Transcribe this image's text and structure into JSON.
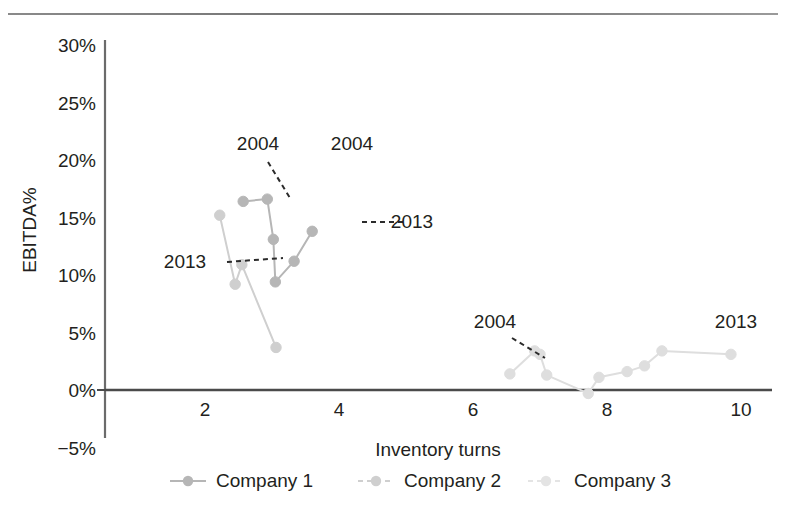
{
  "chart_data": {
    "type": "scatter",
    "title": "",
    "xlabel": "Inventory turns",
    "ylabel": "EBITDA%",
    "xlim": [
      0.3,
      10.6
    ],
    "ylim": [
      -5,
      30
    ],
    "xticks": [
      "2",
      "4",
      "6",
      "8",
      "10"
    ],
    "xtick_values": [
      2,
      4,
      6,
      8,
      10
    ],
    "yticks": [
      "30%",
      "25%",
      "20%",
      "15%",
      "10%",
      "5%",
      "0%",
      "−5%"
    ],
    "ytick_values": [
      30,
      25,
      20,
      15,
      10,
      5,
      0,
      -5
    ],
    "grid": false,
    "legend_position": "bottom",
    "series": [
      {
        "name": "Company 1",
        "color": "#b6b6b6",
        "points": [
          {
            "x": 2.57,
            "y": 16.4
          },
          {
            "x": 2.93,
            "y": 16.6
          },
          {
            "x": 3.02,
            "y": 13.1
          },
          {
            "x": 3.05,
            "y": 9.4
          },
          {
            "x": 3.33,
            "y": 11.2
          },
          {
            "x": 3.6,
            "y": 13.8
          }
        ]
      },
      {
        "name": "Company 2",
        "color": "#cfcfcf",
        "points": [
          {
            "x": 2.22,
            "y": 15.2
          },
          {
            "x": 2.45,
            "y": 9.2
          },
          {
            "x": 2.55,
            "y": 10.9
          },
          {
            "x": 3.06,
            "y": 3.7
          }
        ]
      },
      {
        "name": "Company 3",
        "color": "#dedede",
        "points": [
          {
            "x": 6.55,
            "y": 1.4
          },
          {
            "x": 6.92,
            "y": 3.4
          },
          {
            "x": 7.0,
            "y": 3.1
          },
          {
            "x": 7.1,
            "y": 1.3
          },
          {
            "x": 7.72,
            "y": -0.3
          },
          {
            "x": 7.88,
            "y": 1.1
          },
          {
            "x": 8.3,
            "y": 1.6
          },
          {
            "x": 8.56,
            "y": 2.1
          },
          {
            "x": 8.82,
            "y": 3.4
          },
          {
            "x": 9.85,
            "y": 3.1
          }
        ]
      }
    ],
    "annotations": [
      {
        "id": "annot-2004-left",
        "text": "2004",
        "tx": 258,
        "ty": 150,
        "leader": true,
        "lx1": 268,
        "ly1": 162,
        "lx2": 290,
        "ly2": 198
      },
      {
        "id": "annot-2004-mid",
        "text": "2004",
        "tx": 352,
        "ty": 150,
        "leader": false
      },
      {
        "id": "annot-2013-left",
        "text": "2013",
        "tx": 185,
        "ty": 268,
        "leader": true,
        "lx1": 227,
        "ly1": 262,
        "lx2": 283,
        "ly2": 258
      },
      {
        "id": "annot-2013-mid",
        "text": "2013",
        "tx": 412,
        "ty": 228,
        "leader": true,
        "lx1": 362,
        "ly1": 222,
        "lx2": 406,
        "ly2": 222
      },
      {
        "id": "annot-2004-right",
        "text": "2004",
        "tx": 495,
        "ty": 328,
        "leader": true,
        "lx1": 512,
        "ly1": 338,
        "lx2": 545,
        "ly2": 358
      },
      {
        "id": "annot-2013-right",
        "text": "2013",
        "tx": 736,
        "ty": 328,
        "leader": false
      }
    ]
  },
  "legend": {
    "items": [
      {
        "label": "Company 1",
        "color": "#b6b6b6"
      },
      {
        "label": "Company 2",
        "color": "#cfcfcf"
      },
      {
        "label": "Company 3",
        "color": "#e4e4e4"
      }
    ]
  },
  "axes": {
    "x_title": "Inventory turns",
    "y_title": "EBITDA%"
  }
}
